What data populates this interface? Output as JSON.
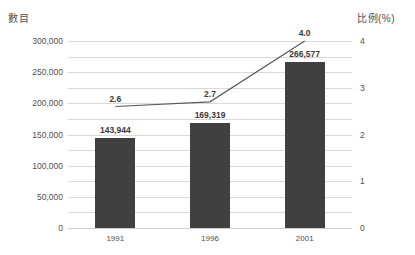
{
  "chart_data": {
    "type": "bar",
    "title": "",
    "categories": [
      "1991",
      "1996",
      "2001"
    ],
    "series": [
      {
        "name": "數目",
        "type": "bar",
        "axis": "left",
        "values": [
          143944,
          169319,
          266577
        ],
        "value_labels": [
          "143,944",
          "169,319",
          "266,577"
        ],
        "color": "#404040"
      },
      {
        "name": "比例(%)",
        "type": "line",
        "axis": "right",
        "values": [
          2.6,
          2.7,
          4.0
        ],
        "value_labels": [
          "2.6",
          "2.7",
          "4.0"
        ],
        "color": "#595959"
      }
    ],
    "xlabel": "",
    "ylabel": "數目",
    "y2label": "比例(%)",
    "ylim": [
      0,
      300000
    ],
    "y2lim": [
      0,
      4
    ],
    "yticks": [
      0,
      50000,
      100000,
      150000,
      200000,
      250000,
      300000
    ],
    "ytick_labels": [
      "0",
      "50,000",
      "100,000",
      "150,000",
      "200,000",
      "250,000",
      "300,000"
    ],
    "y2ticks": [
      0,
      1,
      2,
      3,
      4
    ],
    "y2tick_labels": [
      "0",
      "1",
      "2",
      "3",
      "4"
    ],
    "gridlines": true,
    "gridline_step_left": 50000,
    "legend": "none"
  },
  "axes": {
    "left_title": "數目",
    "right_title": "比例(%)"
  },
  "colors": {
    "bar": "#404040",
    "line": "#595959",
    "grid": "#d9d9d9",
    "text": "#4f4f4f",
    "background": "#ffffff"
  }
}
